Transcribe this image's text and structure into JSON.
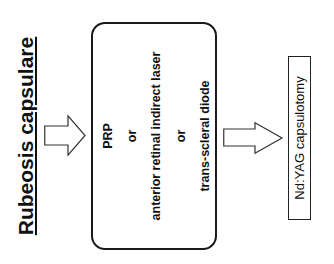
{
  "diagram": {
    "orientation": "rotated -90deg",
    "title": "Rubeosis capsulare",
    "treatment_box": {
      "lines": [
        "PRP",
        "or",
        "anterior retinal indirect laser",
        "or",
        "trans-scleral diode"
      ]
    },
    "outcome_box": {
      "label": "Nd:YAG capsulotomy"
    },
    "arrows": [
      {
        "from": "title",
        "to": "treatment_box"
      },
      {
        "from": "treatment_box",
        "to": "outcome_box"
      }
    ],
    "colors": {
      "stroke": "#1a1a1a",
      "background": "#ffffff"
    }
  }
}
